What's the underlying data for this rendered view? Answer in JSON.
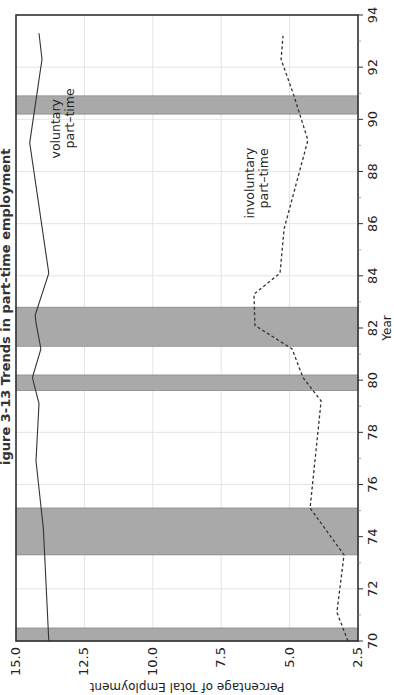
{
  "figure": {
    "title": "igure 3-13  Trends in part-time employment"
  },
  "chart_data": {
    "type": "line",
    "title": "Trends in part-time employment",
    "xlabel": "Year",
    "ylabel": "Percentage of Total Employment",
    "xlim": [
      70,
      94
    ],
    "ylim": [
      2.5,
      15.0
    ],
    "x_ticks": [
      "70",
      "72",
      "74",
      "76",
      "78",
      "80",
      "82",
      "84",
      "86",
      "88",
      "90",
      "92",
      "94"
    ],
    "y_ticks": [
      "2.5",
      "5.0",
      "7.5",
      "10.0",
      "12.5",
      "15.0"
    ],
    "grid": true,
    "orientation_note": "figure rotated 90 degrees counter-clockwise on page",
    "shaded_periods": [
      {
        "start": 70.0,
        "end": 70.5
      },
      {
        "start": 73.3,
        "end": 75.1
      },
      {
        "start": 79.6,
        "end": 80.2
      },
      {
        "start": 81.3,
        "end": 82.8
      },
      {
        "start": 90.2,
        "end": 90.9
      }
    ],
    "series": [
      {
        "name": "voluntary part-time",
        "style": "solid",
        "points": [
          [
            70.0,
            13.8
          ],
          [
            74.3,
            14.0
          ],
          [
            76.9,
            14.27
          ],
          [
            79.1,
            14.16
          ],
          [
            80.1,
            14.4
          ],
          [
            81.2,
            14.09
          ],
          [
            82.2,
            14.27
          ],
          [
            82.5,
            14.3
          ],
          [
            84.1,
            13.8
          ],
          [
            89.1,
            14.5
          ],
          [
            92.3,
            14.05
          ],
          [
            93.3,
            14.16
          ]
        ]
      },
      {
        "name": "involuntary part-time",
        "style": "dashed",
        "points": [
          [
            70.0,
            2.87
          ],
          [
            71.1,
            3.27
          ],
          [
            73.3,
            3.01
          ],
          [
            75.1,
            4.25
          ],
          [
            79.2,
            3.85
          ],
          [
            80.1,
            4.51
          ],
          [
            81.2,
            4.91
          ],
          [
            82.1,
            6.27
          ],
          [
            83.3,
            6.3
          ],
          [
            84.1,
            5.35
          ],
          [
            85.8,
            5.2
          ],
          [
            89.2,
            4.33
          ],
          [
            90.9,
            4.84
          ],
          [
            92.3,
            5.31
          ],
          [
            93.2,
            5.24
          ]
        ]
      }
    ],
    "annotations": [
      {
        "text": [
          "voluntary",
          "part–time"
        ],
        "x": 88.5,
        "y": 13.4
      },
      {
        "text": [
          "involuntary",
          "part–time"
        ],
        "x": 86.2,
        "y": 6.3
      }
    ]
  },
  "colors": {
    "shade": "#a9a9a9",
    "grid": "#e4e4e4",
    "line": "#333333",
    "frame": "#333333"
  }
}
